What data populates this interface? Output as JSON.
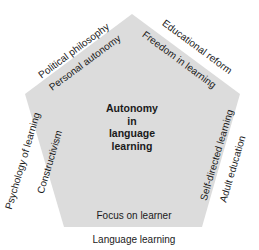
{
  "diagram": {
    "shape": "pentagon",
    "fill_color": "#dcdcdc",
    "center": {
      "lines": [
        "Autonomy",
        "in",
        "language",
        "learning"
      ]
    },
    "inner_labels": {
      "top_left": "Personal autonomy",
      "top_right": "Freedom in learning",
      "left": "Constructivism",
      "right": "Self-directed learning",
      "bottom": "Focus on learner"
    },
    "outer_labels": {
      "top_left": "Political philosophy",
      "top_right": "Educational reform",
      "left": "Psychology of learning",
      "right": "Adult education",
      "bottom": "Language learning"
    }
  }
}
